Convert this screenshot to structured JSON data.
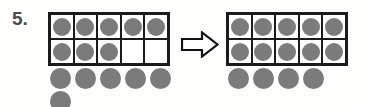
{
  "worksheet": {
    "problem_number": "5.",
    "colors": {
      "counter_fill": "#7b7b7b",
      "frame_border": "#1b1b1b",
      "background": "#fdfdfc",
      "number_text": "#4c4c4c"
    },
    "left_model": {
      "name": "left-ten-frame",
      "top_row": [
        "filled",
        "filled",
        "filled",
        "filled",
        "filled"
      ],
      "bottom_row": [
        "filled",
        "filled",
        "filled",
        "empty",
        "empty"
      ],
      "filled_count": 8,
      "loose_counters_row1": 5,
      "loose_counters_row2": 1,
      "loose_total": 6,
      "total": 14
    },
    "arrow": {
      "name": "right-arrow-icon",
      "direction": "right",
      "style": "hollow-block-arrow"
    },
    "right_model": {
      "name": "right-ten-frame",
      "top_row": [
        "filled",
        "filled",
        "filled",
        "filled",
        "filled"
      ],
      "bottom_row": [
        "filled",
        "filled",
        "filled",
        "filled",
        "filled"
      ],
      "filled_count": 10,
      "loose_counters_row1": 4,
      "loose_total": 4,
      "total": 14
    }
  }
}
